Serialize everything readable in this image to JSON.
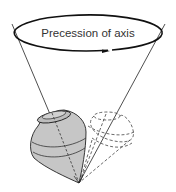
{
  "diagram": {
    "title": "Precession of axis",
    "label": "Precession of axis",
    "elements": [
      {
        "name": "precession-ellipse",
        "description": "Ellipse with arrow indicating direction of precession"
      },
      {
        "name": "precession-cone",
        "description": "Cone traced by axis of spinning top"
      },
      {
        "name": "spinning-top",
        "description": "Shaded spinning top tilted on its tip"
      },
      {
        "name": "ghost-top",
        "description": "Dashed outline of top at another position of precession"
      }
    ],
    "colors": {
      "stroke": "#222222",
      "top_fill": "#c8c8c8",
      "dashed": "#555555",
      "background": "#ffffff"
    }
  }
}
